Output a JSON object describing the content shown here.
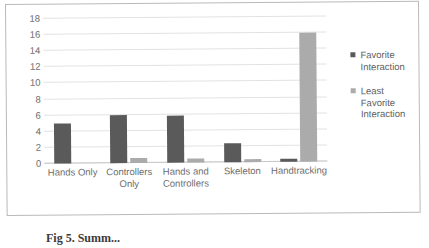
{
  "chart_data": {
    "type": "bar",
    "title": "",
    "subtitle": "",
    "xlabel": "",
    "ylabel": "",
    "categories": [
      "Hands Only",
      "Controllers Only",
      "Hands and Controllers",
      "Skeleton",
      "Handtracking"
    ],
    "series": [
      {
        "name": "Favorite Interaction",
        "color": "#5a5a5a",
        "values": [
          5,
          6,
          5.8,
          2.3,
          0.4
        ]
      },
      {
        "name": "Least Favorite Interaction",
        "color": "#ababab",
        "values": [
          0,
          0.6,
          0.5,
          0.4,
          16
        ]
      }
    ],
    "ylim": [
      0,
      18
    ],
    "ytick_step": 2,
    "yticks": [
      "18",
      "16",
      "14",
      "12",
      "10",
      "8",
      "6",
      "4",
      "2",
      "0"
    ],
    "grid": true,
    "grid_axis": "y",
    "legend_position": "right"
  },
  "legend": {
    "entries": [
      {
        "label": "Favorite Interaction",
        "swatch": "favorite"
      },
      {
        "label": "Least Favorite Interaction",
        "swatch": "least"
      }
    ]
  },
  "caption": {
    "text": "Fig 5. Summ..."
  },
  "colors": {
    "favorite": "#5a5a5a",
    "least": "#ababab",
    "gridline": "#e2e2e2",
    "axis_text": "#6d6d6d",
    "frame": "#b9b9b9"
  }
}
